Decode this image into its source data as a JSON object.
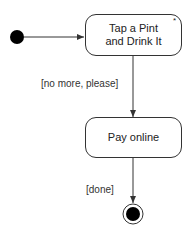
{
  "diagram": {
    "type": "uml-activity",
    "nodes": {
      "initial": {
        "kind": "initial-node"
      },
      "tap_pint": {
        "label_line1": "Tap a Pint",
        "label_line2": "and Drink It",
        "marker": "*"
      },
      "pay_online": {
        "label": "Pay online"
      },
      "final": {
        "kind": "final-node"
      }
    },
    "edges": [
      {
        "from": "initial",
        "to": "tap_pint",
        "guard": ""
      },
      {
        "from": "tap_pint",
        "to": "pay_online",
        "guard": "[no more, please]"
      },
      {
        "from": "pay_online",
        "to": "final",
        "guard": "[done]"
      }
    ],
    "colors": {
      "stroke": "#333333",
      "fill": "#000000",
      "background": "#ffffff"
    }
  }
}
